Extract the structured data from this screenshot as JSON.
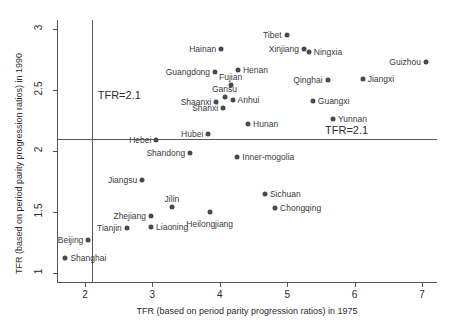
{
  "chart_data": {
    "type": "scatter",
    "title": "",
    "xlabel": "TFR (based on period parity progression ratios) in 1975",
    "ylabel": "TFR (based on period parity progression ratios) in 1990",
    "xlim": [
      1.55,
      7.35
    ],
    "ylim": [
      0.92,
      3.05
    ],
    "xticks": [
      2,
      3,
      4,
      5,
      6,
      7
    ],
    "xticklabels": [
      "2",
      "3",
      "4",
      "5",
      "6",
      "7"
    ],
    "yticks": [
      1,
      1.5,
      2,
      2.5,
      3
    ],
    "yticklabels": [
      "1",
      "1.5",
      "2",
      "2.5",
      "3"
    ],
    "grid": false,
    "legend": null,
    "reference_lines": [
      {
        "orientation": "vertical",
        "value": 2.1,
        "label": "TFR=2.1"
      },
      {
        "orientation": "horizontal",
        "value": 2.1,
        "label": "TFR=2.1"
      }
    ],
    "points": [
      {
        "name": "Tibet",
        "x": 4.99,
        "y": 2.95,
        "label_side": "left"
      },
      {
        "name": "Xinjiang",
        "x": 5.25,
        "y": 2.84,
        "label_side": "left"
      },
      {
        "name": "Ningxia",
        "x": 5.32,
        "y": 2.81,
        "label_side": "right"
      },
      {
        "name": "Guizhou",
        "x": 7.06,
        "y": 2.73,
        "label_side": "left"
      },
      {
        "name": "Hainan",
        "x": 4.02,
        "y": 2.84,
        "label_side": "left"
      },
      {
        "name": "Guangdong",
        "x": 3.93,
        "y": 2.65,
        "label_side": "left"
      },
      {
        "name": "Henan",
        "x": 4.27,
        "y": 2.66,
        "label_side": "right"
      },
      {
        "name": "Qinghai",
        "x": 5.6,
        "y": 2.58,
        "label_side": "left"
      },
      {
        "name": "Jiangxi",
        "x": 6.12,
        "y": 2.59,
        "label_side": "right"
      },
      {
        "name": "Fujian",
        "x": 4.16,
        "y": 2.54,
        "label_side": "above"
      },
      {
        "name": "Gansu",
        "x": 4.07,
        "y": 2.44,
        "label_side": "above"
      },
      {
        "name": "Anhui",
        "x": 4.19,
        "y": 2.42,
        "label_side": "right"
      },
      {
        "name": "Shaanxi",
        "x": 3.95,
        "y": 2.4,
        "label_side": "left"
      },
      {
        "name": "Guangxi",
        "x": 5.38,
        "y": 2.41,
        "label_side": "right"
      },
      {
        "name": "Shanxi",
        "x": 4.05,
        "y": 2.35,
        "label_side": "left"
      },
      {
        "name": "Yunnan",
        "x": 5.68,
        "y": 2.26,
        "label_side": "right"
      },
      {
        "name": "Hunan",
        "x": 4.42,
        "y": 2.22,
        "label_side": "right"
      },
      {
        "name": "Hubei",
        "x": 3.83,
        "y": 2.14,
        "label_side": "left"
      },
      {
        "name": "Hebei",
        "x": 3.06,
        "y": 2.09,
        "label_side": "left"
      },
      {
        "name": "Shandong",
        "x": 3.56,
        "y": 1.98,
        "label_side": "left"
      },
      {
        "name": "Inner-mogolia",
        "x": 4.26,
        "y": 1.95,
        "label_side": "right"
      },
      {
        "name": "Jiangsu",
        "x": 2.85,
        "y": 1.76,
        "label_side": "left"
      },
      {
        "name": "Sichuan",
        "x": 4.67,
        "y": 1.65,
        "label_side": "right"
      },
      {
        "name": "Jilin",
        "x": 3.29,
        "y": 1.54,
        "label_side": "above"
      },
      {
        "name": "Chongqing",
        "x": 4.82,
        "y": 1.53,
        "label_side": "right"
      },
      {
        "name": "Heilongjiang",
        "x": 3.85,
        "y": 1.5,
        "label_side": "below"
      },
      {
        "name": "Zhejiang",
        "x": 2.98,
        "y": 1.47,
        "label_side": "left"
      },
      {
        "name": "Tianjin",
        "x": 2.62,
        "y": 1.37,
        "label_side": "left"
      },
      {
        "name": "Liaoning",
        "x": 2.98,
        "y": 1.38,
        "label_side": "right"
      },
      {
        "name": "Beijing",
        "x": 2.05,
        "y": 1.27,
        "label_side": "left"
      },
      {
        "name": "Shanghai",
        "x": 1.71,
        "y": 1.12,
        "label_side": "right"
      }
    ]
  },
  "colors": {
    "marker": "#4a4a4a",
    "axis": "#555555",
    "text": "#2b2b2b",
    "background": "#ffffff"
  }
}
